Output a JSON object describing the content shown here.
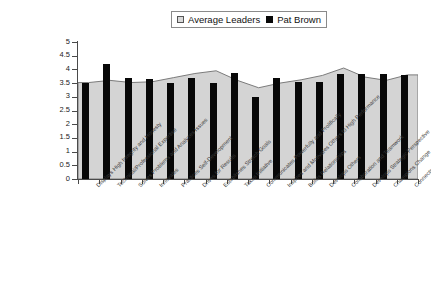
{
  "chart_data": {
    "type": "bar",
    "title": "",
    "subtitle": "",
    "xlabel": "",
    "ylabel": "",
    "ylim": [
      0,
      5
    ],
    "ytick_step": 0.5,
    "yticks": [
      "5",
      "4.5",
      "4",
      "3.5",
      "3",
      "2.5",
      "2",
      "1.5",
      "1",
      "0.5",
      "0"
    ],
    "grid": false,
    "legend_position": "top-center",
    "categories": [
      "Displays High Integrity and Honesty",
      "Technical/Professional Expertise",
      "Solves Problems and Analyzes Issues",
      "Innovates",
      "Practices Self-Development",
      "Drives for Results",
      "Establishes Stretch Goals",
      "Takes Initiative",
      "Communicates Powerfully and Prolifically",
      "Inspires and Motivates Others to High Performance",
      "Builds Relationships",
      "Develops Others",
      "Collaboration and Teamwork",
      "Develops Strategic Perspective",
      "Champions Change",
      "Connects the Group to the Outside World"
    ],
    "series": [
      {
        "name": "Average Leaders",
        "color": "#d4d4d4",
        "style": "area",
        "values": [
          3.52,
          3.6,
          3.52,
          3.55,
          3.7,
          3.85,
          3.95,
          3.6,
          3.33,
          3.5,
          3.62,
          3.78,
          4.05,
          3.72,
          3.6,
          3.8
        ]
      },
      {
        "name": "Pat Brown",
        "color": "#080808",
        "style": "bar",
        "values": [
          3.5,
          4.18,
          3.7,
          3.65,
          3.49,
          3.7,
          3.52,
          3.87,
          2.98,
          3.7,
          3.55,
          3.55,
          3.82,
          3.82,
          3.82,
          3.8
        ]
      }
    ]
  },
  "legend": {
    "entries": [
      {
        "label": "Average Leaders",
        "swatch": "open-square-icon"
      },
      {
        "label": "Pat Brown",
        "swatch": "filled-square-icon"
      }
    ]
  }
}
